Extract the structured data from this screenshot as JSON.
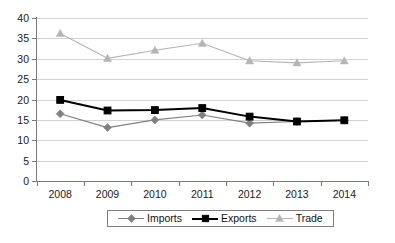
{
  "chart_data": {
    "type": "line",
    "title": "",
    "subtitle": "",
    "xlabel": "",
    "ylabel": "",
    "categories": [
      "2008",
      "2009",
      "2010",
      "2011",
      "2012",
      "2013",
      "2014"
    ],
    "ylim": [
      0,
      40
    ],
    "ytick_step": 5,
    "yticks": [
      "40",
      "35",
      "30",
      "25",
      "20",
      "15",
      "10",
      "5",
      "0"
    ],
    "grid": true,
    "grid_axis": "y",
    "legend_position": "bottom",
    "series": [
      {
        "name": "Imports",
        "marker": "diamond",
        "color": "#808080",
        "values": [
          16.5,
          13.1,
          15.0,
          16.2,
          14.2,
          14.6,
          14.9
        ]
      },
      {
        "name": "Exports",
        "marker": "square",
        "color": "#000000",
        "values": [
          19.9,
          17.3,
          17.4,
          17.9,
          15.8,
          14.6,
          14.9
        ]
      },
      {
        "name": "Trade",
        "marker": "triangle",
        "color": "#b5b5b5",
        "values": [
          36.2,
          30.1,
          32.1,
          33.8,
          29.5,
          29.0,
          29.5
        ]
      }
    ]
  },
  "legend": {
    "items": [
      {
        "label": "Imports",
        "key": "imports-line-marker"
      },
      {
        "label": "Exports",
        "key": "exports-line-marker"
      },
      {
        "label": "Trade",
        "key": "trade-line-marker"
      }
    ]
  },
  "caption": {
    "text": ""
  },
  "colors": {
    "imports": "#808080",
    "exports": "#000000",
    "trade": "#b5b5b5",
    "grid": "#d2d2d2",
    "axis": "#7a7a7a",
    "text": "#1a1a1a"
  }
}
